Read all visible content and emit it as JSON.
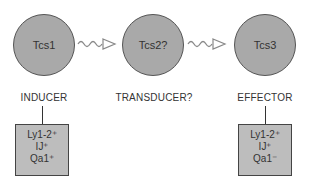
{
  "cells": [
    {
      "name": "Tcs1",
      "role": "INDUCER",
      "markers": [
        "Ly1-2⁺",
        "IJ⁺",
        "Qa1⁺"
      ]
    },
    {
      "name": "Tcs2?",
      "role": "TRANSDUCER?"
    },
    {
      "name": "Tcs3",
      "role": "EFFECTOR",
      "markers": [
        "Ly1-2⁺",
        "IJ⁺",
        "Qa1⁻"
      ]
    }
  ],
  "colors": {
    "cell_fill": "#a9a9a9",
    "box_fill": "#bdbdbd",
    "arrow": "#888888"
  }
}
